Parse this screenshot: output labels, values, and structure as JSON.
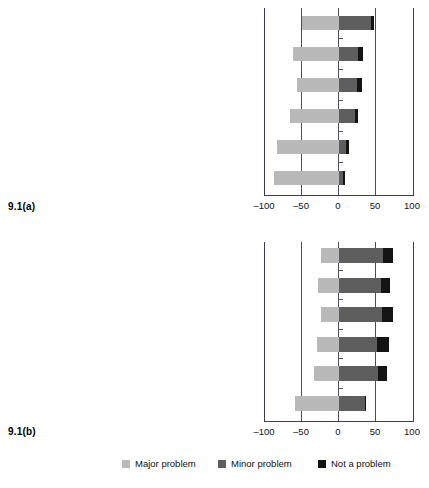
{
  "figure": {
    "panel_a_label": "9.1(a)",
    "panel_b_label": "9.1(b)"
  },
  "legend": {
    "items": [
      {
        "label": "Major problem",
        "color": "#b9b9b9",
        "icon": "square-swatch-icon"
      },
      {
        "label": "Minor problem",
        "color": "#5e5e5e",
        "icon": "square-swatch-icon"
      },
      {
        "label": "Not a problem",
        "color": "#141414",
        "icon": "square-swatch-icon"
      }
    ]
  },
  "axis": {
    "ticks": [
      "-100",
      "-50",
      "0",
      "50",
      "100"
    ],
    "tick_values": [
      -100,
      -50,
      0,
      50,
      100
    ],
    "min": -100,
    "max": 100
  },
  "chart_data": [
    {
      "type": "bar",
      "id": "9.1(a)",
      "title": "",
      "orientation": "horizontal",
      "stacked": true,
      "diverging": true,
      "xlabel": "",
      "ylabel": "",
      "xlim": [
        -100,
        100
      ],
      "xticks": [
        -100,
        -50,
        0,
        50,
        100
      ],
      "xticklabels": [
        "-100",
        "-50",
        "0",
        "50",
        "100"
      ],
      "grid": "vertical",
      "legend_position": "bottom",
      "categories": [
        "Insufficient sales/too few customers",
        "Low profits/profitability",
        "Customers look but do not buy",
        "Large variation in sales over time",
        "Too many competitors (informal competition)",
        "Too many formal stores (formal competition)"
      ],
      "series": [
        {
          "name": "Major problem",
          "color": "#b9b9b9",
          "values": [
            -50,
            -62,
            -57,
            -66,
            -84,
            -88
          ]
        },
        {
          "name": "Minor problem",
          "color": "#5e5e5e",
          "values": [
            43,
            26,
            24,
            21,
            9,
            6
          ]
        },
        {
          "name": "Not a problem",
          "color": "#141414",
          "values": [
            4,
            7,
            7,
            5,
            4,
            2
          ]
        }
      ]
    },
    {
      "type": "bar",
      "id": "9.1(b)",
      "title": "",
      "orientation": "horizontal",
      "stacked": true,
      "diverging": true,
      "xlabel": "",
      "ylabel": "",
      "xlim": [
        -100,
        100
      ],
      "xticks": [
        -100,
        -50,
        0,
        50,
        100
      ],
      "xticklabels": [
        "-100",
        "-50",
        "0",
        "50",
        "100"
      ],
      "grid": "vertical",
      "legend_position": "bottom",
      "categories": [
        "Low profits/profitability",
        "Too many competitors (informal competition)",
        "Large variation in sales over time",
        "Customers look but do not buy",
        "Insufficient sales/too few customers",
        "Too many formal stores (formal competition)"
      ],
      "series": [
        {
          "name": "Major problem",
          "color": "#b9b9b9",
          "values": [
            -24,
            -28,
            -25,
            -30,
            -34,
            -60
          ]
        },
        {
          "name": "Minor problem",
          "color": "#5e5e5e",
          "values": [
            60,
            57,
            58,
            52,
            53,
            35
          ]
        },
        {
          "name": "Not a problem",
          "color": "#141414",
          "values": [
            13,
            12,
            15,
            16,
            12,
            1
          ]
        }
      ]
    }
  ]
}
